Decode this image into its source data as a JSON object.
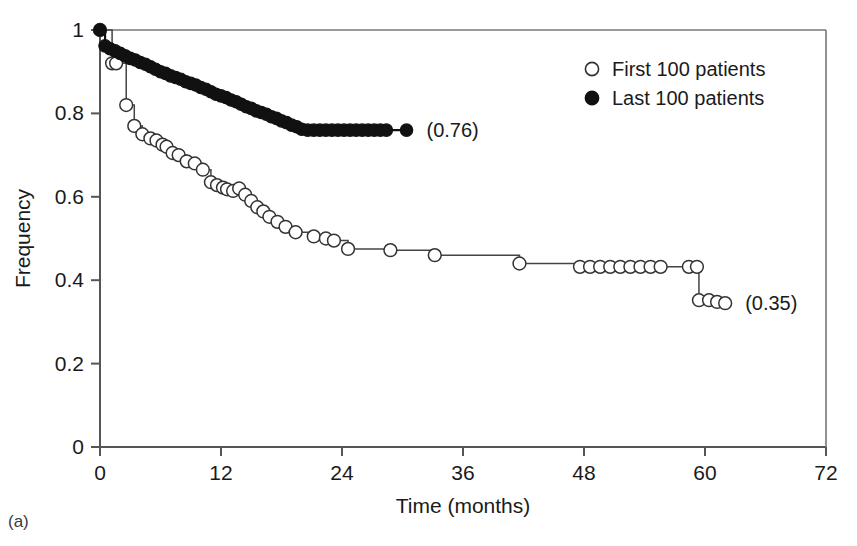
{
  "panel": {
    "label": "(a)"
  },
  "chart_data": {
    "type": "line",
    "title": "",
    "xlabel": "Time (months)",
    "ylabel": "Frequency",
    "xlim": [
      0,
      72
    ],
    "ylim": [
      0,
      1
    ],
    "xticks": [
      0,
      12,
      24,
      36,
      48,
      60,
      72
    ],
    "xtick_labels": [
      "0",
      "12",
      "24",
      "36",
      "48",
      "60",
      "72"
    ],
    "yticks": [
      0,
      0.2,
      0.4,
      0.6,
      0.8,
      1
    ],
    "ytick_labels": [
      "0",
      "0.2",
      "0.4",
      "0.6",
      "0.8",
      "1"
    ],
    "grid": false,
    "legend_position": "top-right",
    "series": [
      {
        "name": "First 100 patients",
        "marker": "open-circle",
        "marker_fill": "#ffffff",
        "marker_stroke": "#333333",
        "line_color": "#444444",
        "endpoint_value": 0.35,
        "endpoint_label": "(0.35)",
        "x": [
          0.0,
          1.2,
          1.6,
          2.6,
          3.4,
          4.2,
          5.0,
          5.6,
          6.2,
          6.6,
          7.2,
          7.8,
          8.6,
          9.4,
          10.2,
          11.0,
          11.6,
          12.2,
          12.6,
          13.2,
          13.8,
          14.4,
          15.0,
          15.6,
          16.2,
          16.8,
          17.6,
          18.4,
          19.4,
          21.2,
          22.4,
          23.2,
          24.6,
          28.8,
          33.2,
          41.6,
          47.6,
          48.6,
          49.6,
          50.6,
          51.6,
          52.6,
          53.6,
          54.6,
          55.6,
          58.4,
          59.2,
          59.4,
          60.4,
          61.2,
          62.0
        ],
        "y": [
          1.0,
          0.92,
          0.92,
          0.82,
          0.77,
          0.75,
          0.74,
          0.735,
          0.725,
          0.72,
          0.705,
          0.7,
          0.685,
          0.68,
          0.665,
          0.635,
          0.628,
          0.622,
          0.618,
          0.614,
          0.62,
          0.605,
          0.59,
          0.575,
          0.565,
          0.552,
          0.54,
          0.528,
          0.515,
          0.505,
          0.5,
          0.495,
          0.475,
          0.472,
          0.46,
          0.44,
          0.432,
          0.432,
          0.432,
          0.432,
          0.432,
          0.432,
          0.432,
          0.432,
          0.432,
          0.432,
          0.432,
          0.352,
          0.352,
          0.348,
          0.345
        ]
      },
      {
        "name": "Last 100 patients",
        "marker": "filled-circle",
        "marker_fill": "#111111",
        "marker_stroke": "#111111",
        "line_color": "#111111",
        "endpoint_value": 0.76,
        "endpoint_label": "(0.76)",
        "x": [
          0.0,
          0.5,
          1.0,
          1.5,
          2.0,
          2.5,
          3.0,
          3.5,
          4.0,
          4.5,
          5.0,
          5.5,
          6.0,
          6.5,
          7.0,
          7.5,
          8.0,
          8.5,
          9.0,
          9.5,
          10.0,
          10.5,
          11.0,
          11.5,
          12.0,
          12.5,
          13.0,
          13.5,
          14.0,
          14.5,
          15.0,
          15.5,
          16.0,
          16.5,
          17.0,
          17.5,
          18.0,
          18.5,
          19.0,
          19.5,
          20.0,
          20.6,
          21.2,
          21.8,
          22.4,
          23.0,
          23.6,
          24.2,
          24.8,
          25.4,
          26.0,
          26.6,
          27.2,
          27.8,
          28.4,
          30.4
        ],
        "y": [
          1.0,
          0.962,
          0.955,
          0.95,
          0.944,
          0.938,
          0.932,
          0.928,
          0.922,
          0.918,
          0.912,
          0.906,
          0.9,
          0.896,
          0.89,
          0.886,
          0.882,
          0.876,
          0.872,
          0.868,
          0.862,
          0.858,
          0.852,
          0.846,
          0.842,
          0.838,
          0.832,
          0.828,
          0.822,
          0.816,
          0.812,
          0.806,
          0.802,
          0.798,
          0.792,
          0.788,
          0.782,
          0.778,
          0.772,
          0.768,
          0.762,
          0.76,
          0.76,
          0.76,
          0.76,
          0.76,
          0.76,
          0.76,
          0.76,
          0.76,
          0.76,
          0.76,
          0.76,
          0.76,
          0.76,
          0.76
        ]
      }
    ]
  }
}
